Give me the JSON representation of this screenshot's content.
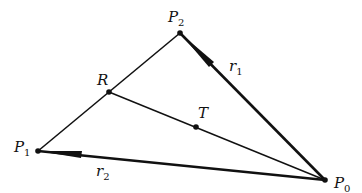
{
  "diagram": {
    "type": "geometric-vector-diagram",
    "points": {
      "P0": {
        "label": "P",
        "sub": "0",
        "x": 325,
        "y": 180
      },
      "P1": {
        "label": "P",
        "sub": "1",
        "x": 38,
        "y": 151
      },
      "P2": {
        "label": "P",
        "sub": "2",
        "x": 180,
        "y": 33
      },
      "R": {
        "label": "R",
        "x": 109,
        "y": 92
      },
      "T": {
        "label": "T",
        "x": 196,
        "y": 127
      }
    },
    "segments": [
      {
        "from": "P1",
        "to": "P2",
        "style": "thin"
      },
      {
        "from": "R",
        "to": "P0",
        "style": "thin"
      },
      {
        "from": "P0",
        "to": "P2",
        "style": "vector",
        "name": "r1"
      },
      {
        "from": "P0",
        "to": "P1",
        "style": "vector",
        "name": "r2"
      }
    ],
    "vector_labels": {
      "r1": {
        "label": "r",
        "sub": "1"
      },
      "r2": {
        "label": "r",
        "sub": "2"
      }
    },
    "colors": {
      "line": "#111111",
      "background": "#ffffff"
    }
  }
}
